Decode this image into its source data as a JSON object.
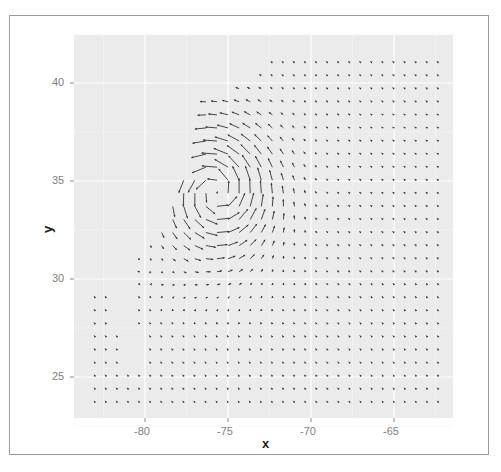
{
  "chart_data": {
    "type": "vector_field",
    "title": "",
    "xlabel": "x",
    "ylabel": "y",
    "xlim": [
      -83.7,
      -61.0
    ],
    "ylim": [
      22.9,
      42.5
    ],
    "xticks": [
      -80,
      -75,
      -70,
      -65
    ],
    "yticks": [
      25,
      30,
      35,
      40
    ],
    "grid": true,
    "legend": null,
    "grid_spacing": {
      "dx": 0.667,
      "dy": 0.667
    },
    "vortex": {
      "center_x": -75.7,
      "center_y": 34.5,
      "rotation": "counter-clockwise",
      "max_arrow_len_deg": 2.6
    },
    "x_range_of_points": [
      -83.0,
      -62.0
    ],
    "y_range_of_points": [
      23.7,
      41.6
    ]
  },
  "colors": {
    "panel_bg": "#ebebeb",
    "grid": "#ffffff",
    "arrow": "#333333",
    "tick_text": "#7f7f7f"
  }
}
